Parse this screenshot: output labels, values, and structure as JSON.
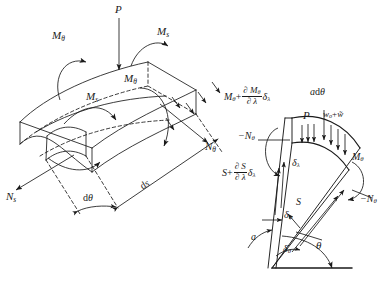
{
  "figure": {
    "type": "engineering-free-body-diagram",
    "stroke_color": "#1a1a1a",
    "background_color": "#ffffff"
  },
  "left_diagram": {
    "name": "three-dimensional curved shell element",
    "labels": {
      "applied_load": "P",
      "moment_theta_top_left": "M",
      "moment_theta_top_left_sub": "θ",
      "moment_s_top_right": "M",
      "moment_s_top_right_sub": "s",
      "moment_theta_mid_right": "M",
      "moment_theta_mid_right_sub": "θ",
      "moment_s_front": "M",
      "moment_s_front_sub": "s",
      "normal_force_theta": "N",
      "normal_force_theta_sub": "θ",
      "normal_force_s": "N",
      "normal_force_s_sub": "s",
      "arc_increment": "d",
      "arc_increment_var": "θ",
      "length_increment": "d",
      "length_increment_var": "s"
    }
  },
  "right_diagram": {
    "name": "two-dimensional cross-sectional free body diagram",
    "labels": {
      "moment_theta_incremented_base": "M",
      "moment_theta_incremented_sub": "θ",
      "moment_theta_incremented_plus": "+",
      "moment_partial_num": "∂ M",
      "moment_partial_num_sub": "θ",
      "moment_partial_den": "∂ λ",
      "moment_partial_delta": "δ",
      "moment_partial_delta_sub": "λ",
      "shear_incremented_base": "S",
      "shear_incremented_plus": "+",
      "shear_partial_num": "∂ S",
      "shear_partial_den": "∂ λ",
      "shear_partial_delta": "δ",
      "shear_partial_delta_sub": "λ",
      "shear": "S",
      "negative_normal_theta_left": "−N",
      "negative_normal_theta_left_sub": "θ",
      "negative_normal_theta_right": "−N",
      "negative_normal_theta_right_sub": "θ",
      "moment_theta_right": "M",
      "moment_theta_right_sub": "θ",
      "applied_load": "P",
      "arc_length": "a",
      "arc_length_d": "d",
      "arc_length_theta": "θ",
      "displacement": "w",
      "displacement_sub": "o",
      "displacement_plus": "+",
      "displacement_tilde": "w̃",
      "delta_lambda": "δ",
      "delta_lambda_sub": "λ",
      "delta_phi": "δ",
      "delta_phi_sub": "φ",
      "delta_theta": "δ",
      "delta_theta_sub": "θ",
      "radius": "a",
      "angle": "θ"
    }
  }
}
